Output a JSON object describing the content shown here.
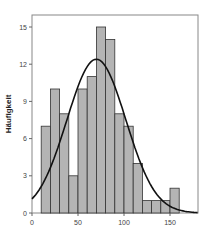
{
  "chart_data": {
    "type": "bar",
    "subtype": "histogram",
    "title": "",
    "xlabel": "",
    "ylabel": "Häufigkeit",
    "bin_width": 10,
    "bins": [
      [
        10,
        20
      ],
      [
        20,
        30
      ],
      [
        30,
        40
      ],
      [
        40,
        50
      ],
      [
        50,
        60
      ],
      [
        60,
        70
      ],
      [
        70,
        80
      ],
      [
        80,
        90
      ],
      [
        90,
        100
      ],
      [
        100,
        110
      ],
      [
        110,
        120
      ],
      [
        120,
        130
      ],
      [
        130,
        140
      ],
      [
        140,
        150
      ],
      [
        150,
        160
      ]
    ],
    "categories": [
      "10-20",
      "20-30",
      "30-40",
      "40-50",
      "50-60",
      "60-70",
      "70-80",
      "80-90",
      "90-100",
      "100-110",
      "110-120",
      "120-130",
      "130-140",
      "140-150",
      "150-160"
    ],
    "values": [
      7,
      10,
      8,
      3,
      10,
      11,
      15,
      14,
      8,
      7,
      4,
      1,
      1,
      1,
      2
    ],
    "xlim": [
      0,
      180
    ],
    "ylim": [
      0,
      16
    ],
    "x_ticks": [
      0,
      50,
      100,
      150
    ],
    "y_ticks": [
      0,
      3,
      6,
      9,
      12,
      15
    ],
    "overlay": {
      "type": "normal_curve",
      "mean": 70,
      "sd": 32,
      "peak": 12.4
    },
    "grid": false,
    "legend": null,
    "colors": {
      "bar_fill": "#b4b4b4",
      "bar_stroke": "#333333",
      "curve": "#111111",
      "frame": "#888888"
    }
  }
}
